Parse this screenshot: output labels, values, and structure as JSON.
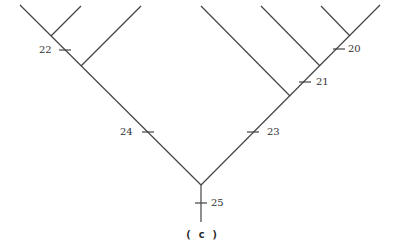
{
  "diagram": {
    "type": "cladogram",
    "caption": "( c )",
    "line_color": "#444444",
    "nodes": {
      "root": [
        201,
        185
      ],
      "root_bottom": [
        201,
        222
      ],
      "left_top": [
        20,
        5
      ],
      "right_top": [
        380,
        5
      ]
    },
    "branches": [
      {
        "from": [
          201,
          185
        ],
        "to": [
          20,
          5
        ]
      },
      {
        "from": [
          201,
          185
        ],
        "to": [
          380,
          5
        ]
      },
      {
        "from": [
          51,
          36
        ],
        "to": [
          81,
          6
        ]
      },
      {
        "from": [
          81,
          66
        ],
        "to": [
          141,
          6
        ]
      },
      {
        "from": [
          290,
          96
        ],
        "to": [
          201,
          6
        ]
      },
      {
        "from": [
          320,
          66
        ],
        "to": [
          261,
          6
        ]
      },
      {
        "from": [
          350,
          36
        ],
        "to": [
          321,
          6
        ]
      }
    ],
    "marks": [
      {
        "label": "20",
        "tick": [
          339,
          49
        ],
        "label_pos": [
          348,
          44
        ]
      },
      {
        "label": "21",
        "tick": [
          305,
          82
        ],
        "label_pos": [
          316,
          77
        ]
      },
      {
        "label": "22",
        "tick": [
          65,
          50
        ],
        "label_pos": [
          39,
          45
        ]
      },
      {
        "label": "23",
        "tick": [
          253,
          132
        ],
        "label_pos": [
          267,
          127
        ]
      },
      {
        "label": "24",
        "tick": [
          148,
          132
        ],
        "label_pos": [
          120,
          127
        ]
      },
      {
        "label": "25",
        "tick": [
          201,
          203
        ],
        "label_pos": [
          211,
          198
        ]
      }
    ]
  }
}
